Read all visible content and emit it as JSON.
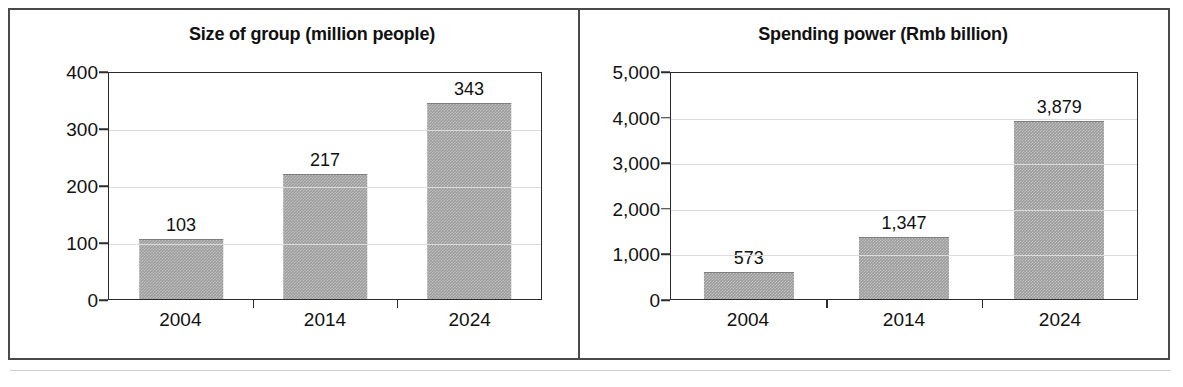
{
  "figure": {
    "panel_count": 2
  },
  "chart_data": [
    {
      "type": "bar",
      "title": "Size of group (million people)",
      "xlabel": "",
      "ylabel": "",
      "categories": [
        "2004",
        "2014",
        "2024"
      ],
      "values": [
        103,
        217,
        343
      ],
      "value_labels": [
        "103",
        "217",
        "343"
      ],
      "ylim": [
        0,
        400
      ],
      "yticks": [
        0,
        100,
        200,
        300,
        400
      ],
      "ytick_labels": [
        "0",
        "100",
        "200",
        "300",
        "400"
      ],
      "grid": true,
      "legend": "none",
      "bar_color": "#9a9a9a"
    },
    {
      "type": "bar",
      "title": "Spending power (Rmb billion)",
      "xlabel": "",
      "ylabel": "",
      "categories": [
        "2004",
        "2014",
        "2024"
      ],
      "values": [
        573,
        1347,
        3879
      ],
      "value_labels": [
        "573",
        "1,347",
        "3,879"
      ],
      "ylim": [
        0,
        5000
      ],
      "yticks": [
        0,
        1000,
        2000,
        3000,
        4000,
        5000
      ],
      "ytick_labels": [
        "0",
        "1,000",
        "2,000",
        "3,000",
        "4,000",
        "5,000"
      ],
      "grid": true,
      "legend": "none",
      "bar_color": "#9a9a9a"
    }
  ]
}
